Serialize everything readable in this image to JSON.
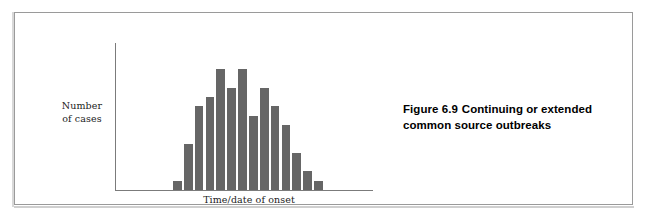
{
  "figure": {
    "caption_line_1_prefix": "Figure 6.9",
    "caption_line_1_rest": "Continuing or extended",
    "caption_line_2": "common source outbreaks",
    "caption_full": "Figure 6.9  Continuing or extended common source outbreaks"
  },
  "colors": {
    "bar_fill": "#666666",
    "axis_line": "#7b7b7b",
    "frame_border": "#9a9a9a",
    "text": "#000000",
    "background": "#ffffff"
  },
  "chart_data": {
    "type": "bar",
    "title": "",
    "subtitle": "",
    "xlabel": "Time/date of onset",
    "ylabel": "Number of cases",
    "ylabel_lines": [
      "Number",
      "of cases"
    ],
    "grid": false,
    "legend": false,
    "legend_position": "none",
    "axis_ticks_shown": false,
    "tick_labels_x": [],
    "tick_labels_y": [],
    "xlim_description": "unlabelled time axis, left to right",
    "ylim": [
      0,
      14
    ],
    "categories": [
      "1",
      "2",
      "3",
      "4",
      "5",
      "6",
      "7",
      "8",
      "9",
      "10",
      "11",
      "12",
      "13",
      "14"
    ],
    "values": [
      1,
      5,
      9,
      10,
      13,
      11,
      13,
      8,
      11,
      9,
      7,
      4,
      2,
      1
    ],
    "annotation": "Epidemic curve showing a continuing or extended common source outbreak: a gradual rise, a broad irregular plateau of high case counts spanning several time units, then a decline."
  }
}
